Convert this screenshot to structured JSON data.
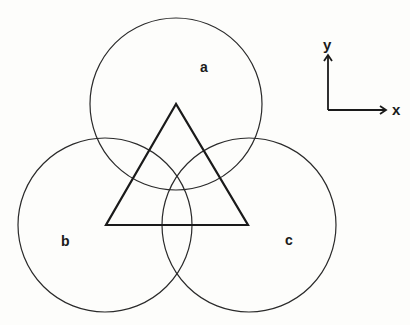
{
  "diagram": {
    "circles": [
      {
        "id": "a",
        "label": "a",
        "cx": 176,
        "cy": 104,
        "r": 86,
        "label_x": 200,
        "label_y": 72
      },
      {
        "id": "b",
        "label": "b",
        "cx": 105,
        "cy": 225,
        "r": 87,
        "label_x": 61,
        "label_y": 246
      },
      {
        "id": "c",
        "label": "c",
        "cx": 249,
        "cy": 225,
        "r": 87,
        "label_x": 285,
        "label_y": 245
      }
    ],
    "triangle": {
      "vertices": [
        [
          176,
          104
        ],
        [
          106,
          225
        ],
        [
          248,
          225
        ]
      ]
    },
    "axes": {
      "origin": [
        328,
        110
      ],
      "x_end": [
        386,
        110
      ],
      "y_end": [
        328,
        55
      ],
      "x_label": "x",
      "y_label": "y"
    }
  }
}
